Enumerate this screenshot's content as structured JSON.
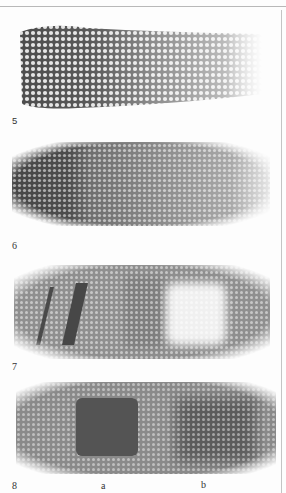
{
  "page": {
    "type": "scanned illustration plate",
    "swatches": [
      {
        "number": "5",
        "description": "Hatched pencil texture, dark on left fading to light on right"
      },
      {
        "number": "6",
        "description": "Textured tone, dark solid area on left blending to lighter texture on right"
      },
      {
        "number": "7",
        "description": "Mid-gray textured ground with two dark diagonal strokes at left and a lifted white square at right"
      },
      {
        "number": "8",
        "description": "Mid-gray textured ground with a dark hard-edged square (a) and a soft dark square (b)",
        "sublabels": [
          "a",
          "b"
        ]
      }
    ]
  },
  "colors": {
    "paper": "#fdfdfd",
    "dark_tone": "#4a4a4a",
    "mid_tone": "#8a8a8a",
    "light_tone": "#c8c8c8",
    "rule": "#b8b8b8"
  }
}
